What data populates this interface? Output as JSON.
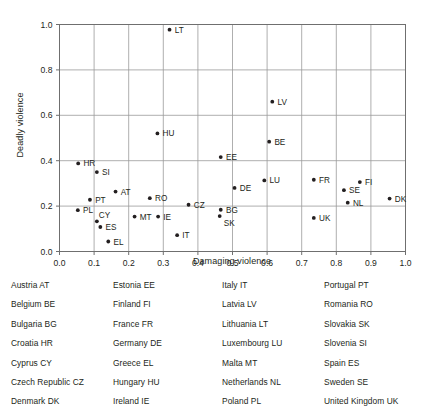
{
  "chart_data": {
    "type": "scatter",
    "title": "",
    "xlabel": "Damaging violence",
    "ylabel": "Deadly violence",
    "xlim": [
      0.0,
      1.0
    ],
    "ylim": [
      0.0,
      1.0
    ],
    "xticks": [
      "0.0",
      "0.1",
      "0.2",
      "0.3",
      "0.4",
      "0.5",
      "0.6",
      "0.7",
      "0.8",
      "0.9",
      "1.0"
    ],
    "xtick_values": [
      0.0,
      0.1,
      0.2,
      0.3,
      0.4,
      0.5,
      0.6,
      0.7,
      0.8,
      0.9,
      1.0
    ],
    "yticks": [
      "0.0",
      "0.2",
      "0.4",
      "0.6",
      "0.8",
      "1.0"
    ],
    "ytick_values": [
      0.0,
      0.2,
      0.4,
      0.6,
      0.8,
      1.0
    ],
    "grid": true,
    "grid_x_step": 0.1,
    "grid_y_step": 0.2,
    "legend": "none",
    "marker_color": "#231f20",
    "points": [
      {
        "label": "LT",
        "x": 0.318,
        "y": 0.977,
        "label_pos": "right"
      },
      {
        "label": "LV",
        "x": 0.615,
        "y": 0.66,
        "label_pos": "right"
      },
      {
        "label": "HU",
        "x": 0.283,
        "y": 0.52,
        "label_pos": "right"
      },
      {
        "label": "BE",
        "x": 0.606,
        "y": 0.484,
        "label_pos": "right"
      },
      {
        "label": "EE",
        "x": 0.466,
        "y": 0.416,
        "label_pos": "right"
      },
      {
        "label": "HR",
        "x": 0.054,
        "y": 0.388,
        "label_pos": "right"
      },
      {
        "label": "SI",
        "x": 0.108,
        "y": 0.35,
        "label_pos": "right"
      },
      {
        "label": "FI",
        "x": 0.868,
        "y": 0.306,
        "label_pos": "right"
      },
      {
        "label": "LU",
        "x": 0.592,
        "y": 0.313,
        "label_pos": "right"
      },
      {
        "label": "FR",
        "x": 0.735,
        "y": 0.316,
        "label_pos": "right"
      },
      {
        "label": "DE",
        "x": 0.506,
        "y": 0.28,
        "label_pos": "right"
      },
      {
        "label": "SE",
        "x": 0.822,
        "y": 0.27,
        "label_pos": "right"
      },
      {
        "label": "AT",
        "x": 0.162,
        "y": 0.264,
        "label_pos": "right"
      },
      {
        "label": "RO",
        "x": 0.261,
        "y": 0.235,
        "label_pos": "right"
      },
      {
        "label": "DK",
        "x": 0.954,
        "y": 0.233,
        "label_pos": "right"
      },
      {
        "label": "PT",
        "x": 0.088,
        "y": 0.228,
        "label_pos": "right"
      },
      {
        "label": "NL",
        "x": 0.833,
        "y": 0.215,
        "label_pos": "right"
      },
      {
        "label": "CZ",
        "x": 0.373,
        "y": 0.206,
        "label_pos": "right"
      },
      {
        "label": "PL",
        "x": 0.053,
        "y": 0.182,
        "label_pos": "right"
      },
      {
        "label": "BG",
        "x": 0.466,
        "y": 0.184,
        "label_pos": "right"
      },
      {
        "label": "IE",
        "x": 0.285,
        "y": 0.154,
        "label_pos": "right"
      },
      {
        "label": "MT",
        "x": 0.217,
        "y": 0.154,
        "label_pos": "right"
      },
      {
        "label": "SK",
        "x": 0.463,
        "y": 0.156,
        "label_pos": "below-right"
      },
      {
        "label": "UK",
        "x": 0.735,
        "y": 0.148,
        "label_pos": "right"
      },
      {
        "label": "CY",
        "x": 0.108,
        "y": 0.133,
        "label_pos": "above-right"
      },
      {
        "label": "ES",
        "x": 0.118,
        "y": 0.108,
        "label_pos": "right"
      },
      {
        "label": "IT",
        "x": 0.34,
        "y": 0.072,
        "label_pos": "right"
      },
      {
        "label": "EL",
        "x": 0.141,
        "y": 0.044,
        "label_pos": "right"
      }
    ]
  },
  "country_key": {
    "columns": [
      {
        "items": [
          "Austria AT",
          "Belgium BE",
          "Bulgaria BG",
          "Croatia HR",
          "Cyprus CY",
          "Czech Republic CZ",
          "Denmark DK"
        ]
      },
      {
        "items": [
          "Estonia EE",
          "Finland FI",
          "France FR",
          "Germany DE",
          "Greece EL",
          "Hungary HU",
          "Ireland IE"
        ]
      },
      {
        "items": [
          "Italy IT",
          "Latvia LV",
          "Lithuania LT",
          "Luxembourg LU",
          "Malta MT",
          "Netherlands NL",
          "Poland PL"
        ]
      },
      {
        "items": [
          "Portugal PT",
          "Romania RO",
          "Slovakia SK",
          "Slovenia SI",
          "Spain ES",
          "Sweden SE",
          "United Kingdom UK"
        ]
      }
    ]
  },
  "style": {
    "frame_color": "#6f6f6f",
    "grid_color": "#9a9a9a",
    "text_color": "#231f20"
  }
}
